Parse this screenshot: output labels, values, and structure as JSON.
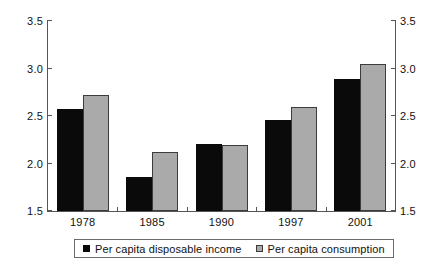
{
  "chart_data": {
    "type": "bar",
    "title": "",
    "subtitle": "",
    "xlabel": "",
    "ylabel": "",
    "categories": [
      "1978",
      "1985",
      "1990",
      "1997",
      "2001"
    ],
    "series": [
      {
        "name": "Per capita disposable income",
        "color": "#0a0a0a",
        "values": [
          2.57,
          1.86,
          2.21,
          2.46,
          2.89
        ]
      },
      {
        "name": "Per capita consumption",
        "color": "#aaaaaa",
        "values": [
          2.72,
          2.12,
          2.19,
          2.59,
          3.05
        ]
      }
    ],
    "ylim": [
      1.5,
      3.5
    ],
    "y_ticks": [
      1.5,
      2.0,
      2.5,
      3.0,
      3.5
    ],
    "y_tick_labels_left": [
      "1.5",
      "2.0",
      "2.5",
      "3.0",
      "3.5"
    ],
    "y_tick_labels_right": [
      "1.5",
      "2.0",
      "2.5",
      "3.0",
      "3.5"
    ],
    "grid": false,
    "legend_position": "bottom",
    "axis_right_visible": true,
    "frame_color": "#555555"
  }
}
